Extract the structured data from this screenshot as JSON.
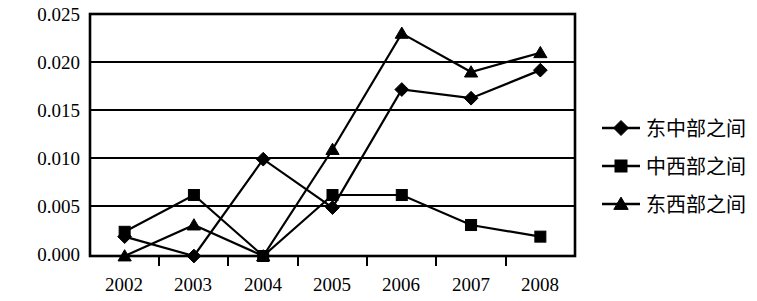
{
  "chart_data": {
    "type": "line",
    "title": "",
    "subtitle": "",
    "xlabel": "",
    "ylabel": "",
    "categories": [
      "2002",
      "2003",
      "2004",
      "2005",
      "2006",
      "2007",
      "2008"
    ],
    "ylim": [
      0.0,
      0.025
    ],
    "ytick_labels": [
      "0.000",
      "0.005",
      "0.010",
      "0.015",
      "0.020",
      "0.025"
    ],
    "ytick_values": [
      0.0,
      0.005,
      0.01,
      0.015,
      0.02,
      0.025
    ],
    "grid": "horizontal",
    "legend_position": "right",
    "series": [
      {
        "name": "东中部之间",
        "marker": "diamond",
        "color": "#000000",
        "values": [
          0.002,
          0.0,
          0.01,
          0.005,
          0.0172,
          0.0163,
          0.0192
        ]
      },
      {
        "name": "中西部之间",
        "marker": "square",
        "color": "#000000",
        "values": [
          0.0025,
          0.0063,
          0.0,
          0.0063,
          0.0063,
          0.0032,
          0.002
        ]
      },
      {
        "name": "东西部之间",
        "marker": "triangle",
        "color": "#000000",
        "values": [
          0.0,
          0.0032,
          0.0,
          0.011,
          0.023,
          0.019,
          0.021
        ]
      }
    ]
  },
  "axis": {
    "y_labels": [
      "0.025",
      "0.020",
      "0.015",
      "0.010",
      "0.005",
      "0.000"
    ],
    "x_labels": [
      "2002",
      "2003",
      "2004",
      "2005",
      "2006",
      "2007",
      "2008"
    ]
  },
  "legend": {
    "items": [
      {
        "label": "东中部之间",
        "marker": "diamond"
      },
      {
        "label": "中西部之间",
        "marker": "square"
      },
      {
        "label": "东西部之间",
        "marker": "triangle"
      }
    ]
  },
  "colors": {
    "foreground": "#000000",
    "background": "#ffffff"
  }
}
